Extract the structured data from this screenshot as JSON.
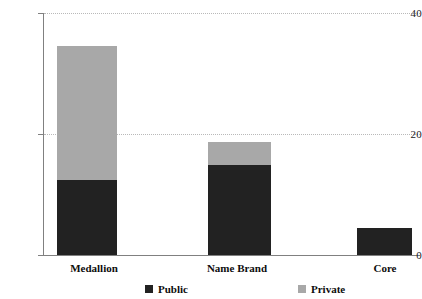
{
  "chart_data": {
    "type": "bar",
    "subtype": "stacked",
    "title": "",
    "subtitle": "",
    "xlabel": "",
    "ylabel": "",
    "categories": [
      "Medallion",
      "Name Brand",
      "Core"
    ],
    "series": [
      {
        "name": "Public",
        "color": "#222222",
        "values": [
          12.4,
          14.9,
          4.5
        ]
      },
      {
        "name": "Private",
        "color": "#a8a8a8",
        "values": [
          22.2,
          3.8,
          0
        ]
      }
    ],
    "totals": [
      34.6,
      18.7,
      4.5
    ],
    "ylim": [
      0,
      40
    ],
    "yticks": [
      0,
      20,
      40
    ],
    "ytick_labels": [
      "0",
      "20",
      "40"
    ],
    "grid": "horizontal-dotted",
    "legend_position": "bottom",
    "legend": [
      {
        "label": "Public",
        "color": "#222222"
      },
      {
        "label": "Private",
        "color": "#a8a8a8"
      }
    ]
  },
  "axis": {
    "y": {
      "tick_40": "40",
      "tick_20": "20",
      "tick_0": "0"
    },
    "x": {
      "cat_0": "Medallion",
      "cat_1": "Name Brand",
      "cat_2": "Core"
    }
  },
  "legend_text": {
    "public": "Public",
    "private": "Private"
  },
  "colors": {
    "public": "#222222",
    "private": "#a8a8a8",
    "axis": "#808080",
    "grid": "#b9b9b9",
    "text": "#0d0d0d",
    "background": "#ffffff"
  }
}
